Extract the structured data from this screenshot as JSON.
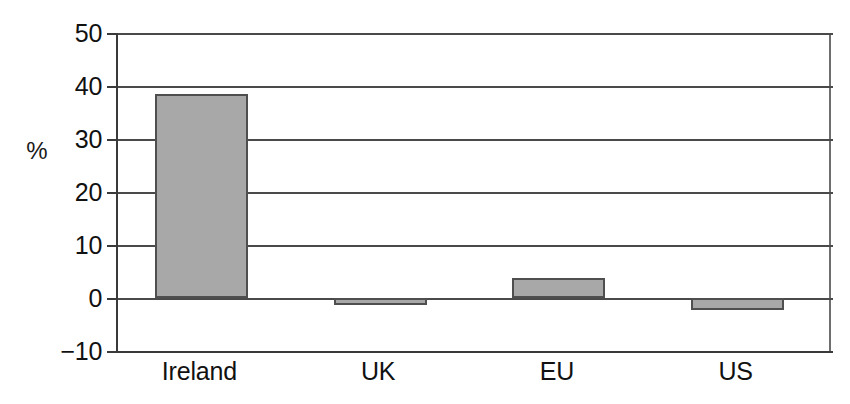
{
  "chart_data": {
    "type": "bar",
    "title": "",
    "xlabel": "",
    "ylabel": "%",
    "categories": [
      "Ireland",
      "UK",
      "EU",
      "US"
    ],
    "values": [
      38.5,
      -1.3,
      3.8,
      -2.2
    ],
    "ylim": [
      -10,
      50
    ],
    "yticks": [
      50,
      40,
      30,
      20,
      10,
      0,
      -10
    ],
    "ytick_labels": [
      "50",
      "40",
      "30",
      "20",
      "10",
      "0",
      "−10"
    ],
    "grid": "horizontal",
    "legend": "none",
    "series": [
      {
        "name": "",
        "values": [
          38.5,
          -1.3,
          3.8,
          -2.2
        ]
      }
    ],
    "bar_fill_color": "#a8a8a8",
    "bar_border_color": "#4f4f4f",
    "axis_color": "#3a3a3a",
    "background_color": "#ffffff"
  },
  "axis": {
    "y_unit_label": "%"
  },
  "ticks": [
    {
      "label": "50",
      "value": 50
    },
    {
      "label": "40",
      "value": 40
    },
    {
      "label": "30",
      "value": 30
    },
    {
      "label": "20",
      "value": 20
    },
    {
      "label": "10",
      "value": 10
    },
    {
      "label": "0",
      "value": 0
    },
    {
      "label": "−10",
      "value": -10
    }
  ],
  "bars": [
    {
      "label": "Ireland",
      "value": 38.5
    },
    {
      "label": "UK",
      "value": -1.3
    },
    {
      "label": "EU",
      "value": 3.8
    },
    {
      "label": "US",
      "value": -2.2
    }
  ]
}
